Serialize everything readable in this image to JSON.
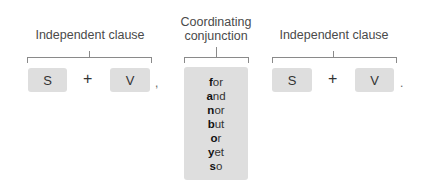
{
  "left_clause": {
    "label": "Independent clause",
    "subject": "S",
    "operator": "+",
    "verb": "V",
    "punctuation": ","
  },
  "conjunction_group": {
    "label_line1": "Coordinating",
    "label_line2": "conjunction",
    "words": [
      {
        "first": "f",
        "rest": "or"
      },
      {
        "first": "a",
        "rest": "nd"
      },
      {
        "first": "n",
        "rest": "or"
      },
      {
        "first": "b",
        "rest": "ut"
      },
      {
        "first": "o",
        "rest": "r"
      },
      {
        "first": "y",
        "rest": "et"
      },
      {
        "first": "s",
        "rest": "o"
      }
    ]
  },
  "right_clause": {
    "label": "Independent clause",
    "subject": "S",
    "operator": "+",
    "verb": "V",
    "punctuation": "."
  },
  "colors": {
    "box_fill": "#dedede",
    "bracket": "#8a8a8a",
    "text": "#333333"
  }
}
